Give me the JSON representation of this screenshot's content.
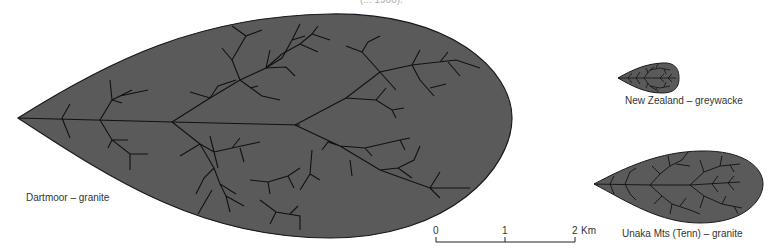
{
  "figure": {
    "caption_fragment": "(... 1960).",
    "fill_color": "#5a5a5a",
    "outline_color": "#1a1a1a",
    "channel_color": "#111111",
    "basins": [
      {
        "id": "dartmoor",
        "label": "Dartmoor – granite",
        "rock": "granite",
        "region": "Dartmoor"
      },
      {
        "id": "new-zealand",
        "label": "New Zealand – greywacke",
        "rock": "greywacke",
        "region": "New Zealand"
      },
      {
        "id": "unaka",
        "label": "Unaka Mts (Tenn) – granite",
        "rock": "granite",
        "region": "Unaka Mts (Tenn)"
      }
    ],
    "scale_bar": {
      "ticks": [
        "0",
        "1",
        "2"
      ],
      "unit": "Km"
    }
  }
}
